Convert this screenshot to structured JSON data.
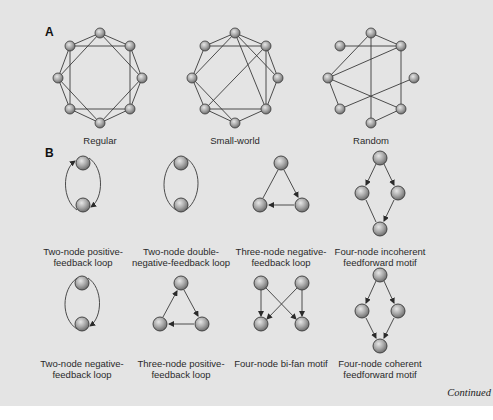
{
  "panel_a": {
    "letter": "A",
    "networks": [
      {
        "label": "Regular",
        "type": "regular"
      },
      {
        "label": "Small-world",
        "type": "small-world"
      },
      {
        "label": "Random",
        "type": "random"
      }
    ]
  },
  "panel_b": {
    "letter": "B",
    "motifs": [
      {
        "label_line1": "Two-node positive-",
        "label_line2": "feedback loop"
      },
      {
        "label_line1": "Two-node double-",
        "label_line2": "negative-feedback loop"
      },
      {
        "label_line1": "Three-node negative-",
        "label_line2": "feedback loop"
      },
      {
        "label_line1": "Four-node incoherent",
        "label_line2": "feedforward motif"
      },
      {
        "label_line1": "Two-node negative-",
        "label_line2": "feedback loop"
      },
      {
        "label_line1": "Three-node positive-",
        "label_line2": "feedback loop"
      },
      {
        "label_line1": "Four-node bi-fan motif",
        "label_line2": ""
      },
      {
        "label_line1": "Four-node coherent",
        "label_line2": "feedforward motif"
      }
    ]
  },
  "footer": {
    "continued": "Continued"
  },
  "colors": {
    "background": "#e4e4e4",
    "edge": "#3a3a3a",
    "node_fill": "#9a9a9a",
    "node_stroke": "#3a3a3a"
  }
}
